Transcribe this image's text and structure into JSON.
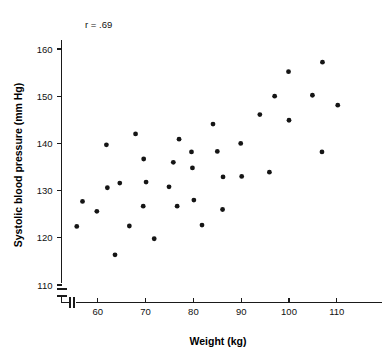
{
  "chart_data": {
    "type": "scatter",
    "title": "",
    "xlabel": "Weight (kg)",
    "ylabel": "Systolic blood pressure (mm Hg)",
    "xlim": [
      55,
      117
    ],
    "ylim": [
      108,
      164
    ],
    "xticks": [
      60,
      70,
      80,
      90,
      100,
      110
    ],
    "yticks": [
      110,
      120,
      130,
      140,
      150,
      160
    ],
    "xtick_labels": [
      "60",
      "70",
      "80",
      "90",
      "100",
      "110"
    ],
    "ytick_labels": [
      "110",
      "120",
      "130",
      "140",
      "150",
      "160"
    ],
    "grid": false,
    "legend": null,
    "axis_break_x": true,
    "axis_break_y": true,
    "annotations": [
      {
        "name": "correlation",
        "text": "r = .69",
        "x": 59.5,
        "y": 162.5
      }
    ],
    "series": [
      {
        "name": "subjects",
        "marker": "circle",
        "color": "#151515",
        "points": [
          {
            "x": 55.6,
            "y": 122.4
          },
          {
            "x": 56.8,
            "y": 127.7
          },
          {
            "x": 59.8,
            "y": 125.6
          },
          {
            "x": 61.8,
            "y": 139.7
          },
          {
            "x": 62.0,
            "y": 130.6
          },
          {
            "x": 63.6,
            "y": 116.4
          },
          {
            "x": 64.6,
            "y": 131.6
          },
          {
            "x": 66.6,
            "y": 122.5
          },
          {
            "x": 67.9,
            "y": 142.0
          },
          {
            "x": 69.6,
            "y": 136.7
          },
          {
            "x": 69.5,
            "y": 126.7
          },
          {
            "x": 70.1,
            "y": 131.8
          },
          {
            "x": 71.8,
            "y": 119.8
          },
          {
            "x": 74.9,
            "y": 130.8
          },
          {
            "x": 75.8,
            "y": 136.0
          },
          {
            "x": 76.6,
            "y": 126.7
          },
          {
            "x": 77.0,
            "y": 140.9
          },
          {
            "x": 79.6,
            "y": 138.2
          },
          {
            "x": 79.8,
            "y": 134.8
          },
          {
            "x": 80.1,
            "y": 128.0
          },
          {
            "x": 81.8,
            "y": 122.7
          },
          {
            "x": 84.1,
            "y": 144.1
          },
          {
            "x": 85.0,
            "y": 138.3
          },
          {
            "x": 86.2,
            "y": 132.9
          },
          {
            "x": 86.1,
            "y": 126.0
          },
          {
            "x": 89.9,
            "y": 140.0
          },
          {
            "x": 90.1,
            "y": 133.0
          },
          {
            "x": 93.9,
            "y": 146.1
          },
          {
            "x": 95.9,
            "y": 133.9
          },
          {
            "x": 97.0,
            "y": 150.0
          },
          {
            "x": 99.9,
            "y": 155.2
          },
          {
            "x": 100.0,
            "y": 144.9
          },
          {
            "x": 104.9,
            "y": 150.2
          },
          {
            "x": 107.0,
            "y": 157.2
          },
          {
            "x": 106.9,
            "y": 138.2
          },
          {
            "x": 110.2,
            "y": 148.1
          }
        ]
      }
    ]
  }
}
